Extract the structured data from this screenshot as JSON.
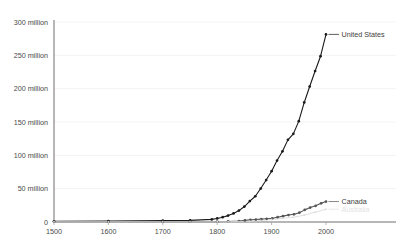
{
  "chart_data": {
    "type": "line",
    "title": "",
    "subtitle": "",
    "xlabel": "",
    "ylabel": "",
    "xlim": [
      1500,
      2000
    ],
    "ylim": [
      0,
      300000000
    ],
    "grid": true,
    "legend_position": "right-inline-labels",
    "y_ticks": [
      0,
      50000000,
      100000000,
      150000000,
      200000000,
      250000000,
      300000000
    ],
    "y_tick_labels": [
      "0",
      "50 million",
      "100 million",
      "150 million",
      "200 million",
      "250 million",
      "300 million"
    ],
    "x_ticks": [
      1500,
      1600,
      1700,
      1800,
      1900,
      2000
    ],
    "x_tick_labels": [
      "1500",
      "1600",
      "1700",
      "1800",
      "1900",
      "2000"
    ],
    "series": [
      {
        "name": "United States",
        "label": "United States",
        "color": "#1a1a1a",
        "marker": "circle",
        "x": [
          1500,
          1600,
          1700,
          1750,
          1790,
          1800,
          1810,
          1820,
          1830,
          1840,
          1850,
          1860,
          1870,
          1880,
          1890,
          1900,
          1910,
          1920,
          1930,
          1940,
          1950,
          1960,
          1970,
          1980,
          1990,
          2000
        ],
        "values": [
          1000000,
          1500000,
          2000000,
          2500000,
          3900000,
          5300000,
          7200000,
          9600000,
          12900000,
          17100000,
          23200000,
          31400000,
          38600000,
          50200000,
          62900000,
          76200000,
          92200000,
          106000000,
          123200000,
          132200000,
          151300000,
          179300000,
          203200000,
          226500000,
          248700000,
          281400000
        ]
      },
      {
        "name": "Canada",
        "label": "Canada",
        "color": "#555555",
        "marker": "circle",
        "x": [
          1500,
          1600,
          1700,
          1750,
          1800,
          1820,
          1840,
          1851,
          1861,
          1871,
          1881,
          1891,
          1901,
          1911,
          1921,
          1931,
          1941,
          1951,
          1961,
          1971,
          1981,
          1991,
          2000
        ],
        "values": [
          500000,
          400000,
          300000,
          400000,
          600000,
          800000,
          1500000,
          2400000,
          3200000,
          3700000,
          4300000,
          4800000,
          5400000,
          7200000,
          8800000,
          10400000,
          11500000,
          14000000,
          18200000,
          21600000,
          24300000,
          28000000,
          30700000
        ]
      },
      {
        "name": "third-series",
        "label": "Australia",
        "color": "#dcdcdc",
        "marker": "circle",
        "x": [
          1500,
          1600,
          1700,
          1750,
          1800,
          1820,
          1840,
          1860,
          1880,
          1900,
          1920,
          1940,
          1960,
          1980,
          2000
        ],
        "values": [
          300000,
          300000,
          300000,
          300000,
          350000,
          400000,
          700000,
          1150000,
          2250000,
          3770000,
          5410000,
          7080000,
          10280000,
          14700000,
          19150000
        ]
      }
    ]
  }
}
